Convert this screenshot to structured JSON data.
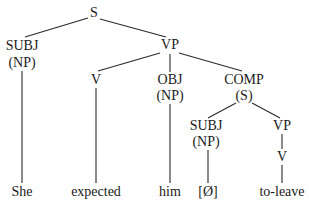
{
  "diagram": {
    "type": "syntax-tree",
    "colors": {
      "line": "#2a2a2a",
      "text": "#1a1a1a",
      "background": "#ffffff"
    },
    "nodes": {
      "s_root": {
        "label": "S",
        "x": 94,
        "y": 13
      },
      "subj": {
        "label": "SUBJ",
        "x": 22,
        "y": 46
      },
      "subj_np": {
        "label": "(NP)",
        "x": 22,
        "y": 63
      },
      "vp": {
        "label": "VP",
        "x": 170,
        "y": 45
      },
      "v": {
        "label": "V",
        "x": 96,
        "y": 80
      },
      "obj": {
        "label": "OBJ",
        "x": 170,
        "y": 80
      },
      "obj_np": {
        "label": "(NP)",
        "x": 170,
        "y": 96
      },
      "comp": {
        "label": "COMP",
        "x": 244,
        "y": 80
      },
      "comp_s": {
        "label": "(S)",
        "x": 244,
        "y": 96
      },
      "subj2": {
        "label": "SUBJ",
        "x": 206,
        "y": 126
      },
      "subj2_np": {
        "label": "(NP)",
        "x": 206,
        "y": 142
      },
      "vp2": {
        "label": "VP",
        "x": 282,
        "y": 126
      },
      "v2": {
        "label": "V",
        "x": 282,
        "y": 157
      },
      "leaf_she": {
        "label": "She",
        "x": 22,
        "y": 192
      },
      "leaf_expected": {
        "label": "expected",
        "x": 96,
        "y": 192
      },
      "leaf_him": {
        "label": "him",
        "x": 170,
        "y": 192
      },
      "leaf_null": {
        "label": "[Ø]",
        "x": 208,
        "y": 192
      },
      "leaf_toleave": {
        "label": "to-leave",
        "x": 282,
        "y": 192
      }
    },
    "edges": [
      {
        "from": "S",
        "to": "SUBJ (NP)",
        "x1": 88,
        "y1": 18,
        "x2": 25,
        "y2": 37
      },
      {
        "from": "S",
        "to": "VP",
        "x1": 100,
        "y1": 19,
        "x2": 166,
        "y2": 37
      },
      {
        "from": "VP",
        "to": "V",
        "x1": 160,
        "y1": 53,
        "x2": 98,
        "y2": 71
      },
      {
        "from": "VP",
        "to": "OBJ (NP)",
        "x1": 170,
        "y1": 54,
        "x2": 170,
        "y2": 72
      },
      {
        "from": "VP",
        "to": "COMP (S)",
        "x1": 179,
        "y1": 53,
        "x2": 242,
        "y2": 71
      },
      {
        "from": "SUBJ (NP)",
        "to": "She",
        "x1": 22,
        "y1": 71,
        "x2": 22,
        "y2": 183
      },
      {
        "from": "V",
        "to": "expected",
        "x1": 96,
        "y1": 88,
        "x2": 96,
        "y2": 183
      },
      {
        "from": "OBJ (NP)",
        "to": "him",
        "x1": 170,
        "y1": 104,
        "x2": 170,
        "y2": 183
      },
      {
        "from": "COMP (S)",
        "to": "SUBJ (NP)",
        "x1": 236,
        "y1": 103,
        "x2": 208,
        "y2": 118
      },
      {
        "from": "COMP (S)",
        "to": "VP",
        "x1": 252,
        "y1": 103,
        "x2": 280,
        "y2": 118
      },
      {
        "from": "SUBJ (NP)",
        "to": "[Ø]",
        "x1": 208,
        "y1": 150,
        "x2": 208,
        "y2": 183
      },
      {
        "from": "VP",
        "to": "V",
        "x1": 282,
        "y1": 134,
        "x2": 282,
        "y2": 149
      },
      {
        "from": "V",
        "to": "to-leave",
        "x1": 282,
        "y1": 165,
        "x2": 282,
        "y2": 183
      }
    ]
  }
}
